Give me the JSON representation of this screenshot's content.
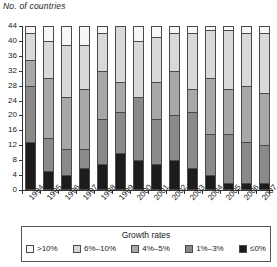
{
  "axis_title": "No. of countries",
  "legend": {
    "title": "Growth rates",
    "items": [
      {
        "label": ">10%",
        "color": "#f7f7f7"
      },
      {
        "label": "6%–10%",
        "color": "#d9d9d9"
      },
      {
        "label": "4%–5%",
        "color": "#a8a8a8"
      },
      {
        "label": "1%–3%",
        "color": "#8a8a8a"
      },
      {
        "label": "≤0%",
        "color": "#1c1c1c"
      }
    ]
  },
  "chart_data": {
    "type": "bar",
    "stacked": true,
    "title": "",
    "xlabel": "",
    "ylabel": "No. of countries",
    "ylim": [
      0,
      44
    ],
    "yticks": [
      0,
      4,
      8,
      12,
      16,
      20,
      24,
      28,
      32,
      36,
      40,
      44
    ],
    "grid": false,
    "legend_position": "bottom",
    "legend_title": "Growth rates",
    "categories": [
      "1994",
      "1995",
      "1996",
      "1997",
      "1998",
      "1999",
      "2000",
      "2001",
      "2002",
      "2003",
      "2004",
      "2005",
      "2006",
      "2007"
    ],
    "series": [
      {
        "name": "≤0%",
        "color": "#1c1c1c",
        "values": [
          13,
          5,
          4,
          6,
          7,
          10,
          8,
          7,
          8,
          6,
          4,
          2,
          2,
          2
        ]
      },
      {
        "name": "1%–3%",
        "color": "#8a8a8a",
        "values": [
          15,
          9,
          7,
          5,
          12,
          11,
          17,
          12,
          12,
          15,
          11,
          13,
          11,
          10
        ]
      },
      {
        "name": "4%–5%",
        "color": "#a8a8a8",
        "values": [
          7,
          16,
          14,
          16,
          13,
          8,
          0,
          10,
          12,
          6,
          15,
          12,
          15,
          14
        ]
      },
      {
        "name": "6%–10%",
        "color": "#d9d9d9",
        "values": [
          7,
          10,
          14,
          12,
          10,
          15,
          15,
          12,
          10,
          15,
          13,
          16,
          14,
          16
        ]
      },
      {
        "name": ">10%",
        "color": "#f7f7f7",
        "values": [
          2,
          4,
          5,
          5,
          2,
          0,
          4,
          3,
          2,
          2,
          1,
          1,
          2,
          2
        ]
      }
    ],
    "totals": [
      44,
      44,
      44,
      44,
      44,
      44,
      44,
      44,
      44,
      44,
      44,
      44,
      44,
      44
    ]
  }
}
